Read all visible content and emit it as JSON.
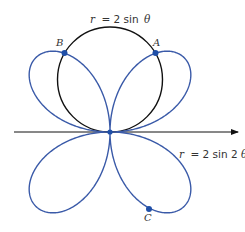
{
  "figure": {
    "circle_label": {
      "lhs": "r",
      "rhs": "= 2 sin ",
      "var": "θ"
    },
    "rose_label": {
      "lhs": "r",
      "rhs": "= 2 sin 2",
      "var": "θ"
    },
    "points": [
      {
        "name": "A",
        "label": "A"
      },
      {
        "name": "B",
        "label": "B"
      },
      {
        "name": "C",
        "label": "C"
      }
    ]
  },
  "colors": {
    "circle": "#111111",
    "rose": "#3a5aa8",
    "point": "#1f4fa8",
    "axis": "#111111"
  },
  "chart_data": {
    "type": "polar-curves",
    "curves": [
      {
        "name": "circle",
        "equation": "r = 2 sin θ"
      },
      {
        "name": "four-leaved rose",
        "equation": "r = 2 sin 2θ"
      }
    ],
    "labeled_points": [
      "A",
      "B",
      "C"
    ],
    "axis": "polar axis (horizontal arrow to the right)"
  }
}
